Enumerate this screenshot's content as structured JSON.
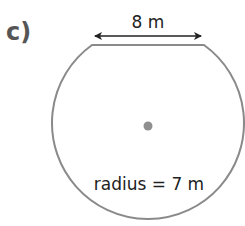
{
  "problem": {
    "part_label": "c)"
  },
  "diagram": {
    "shape": "circle with chord cut off (circular segment removed)",
    "chord_label": "8 m",
    "radius_label": "radius = 7 m",
    "colors": {
      "outline": "#8a8a8a",
      "arrow": "#222222",
      "center_dot": "#8f8f8f",
      "text": "#222222",
      "part_label": "#555555"
    },
    "geometry": {
      "center": [
        148,
        126
      ],
      "radius_px": 96,
      "chord_y": 45,
      "chord_x_start": 92,
      "chord_x_end": 204,
      "arrow_y": 36
    }
  }
}
